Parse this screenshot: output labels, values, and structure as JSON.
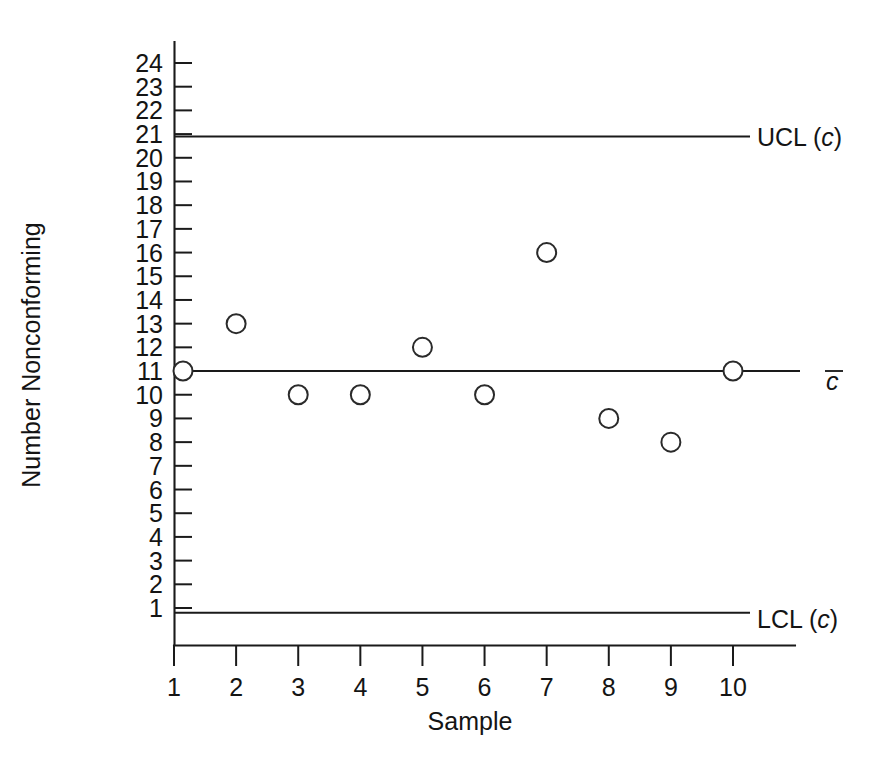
{
  "chart_data": {
    "type": "scatter",
    "title": "",
    "xlabel": "Sample",
    "ylabel": "Number Nonconforming",
    "x": [
      1,
      2,
      3,
      4,
      5,
      6,
      7,
      8,
      9,
      10
    ],
    "values": [
      11,
      13,
      10,
      10,
      12,
      10,
      16,
      9,
      8,
      11
    ],
    "categories": [
      "1",
      "2",
      "3",
      "4",
      "5",
      "6",
      "7",
      "8",
      "9",
      "10"
    ],
    "xtick_labels": [
      "1",
      "2",
      "3",
      "4",
      "5",
      "6",
      "7",
      "8",
      "9",
      "10"
    ],
    "ytick_labels": [
      "1",
      "2",
      "3",
      "4",
      "5",
      "6",
      "7",
      "8",
      "9",
      "10",
      "11",
      "12",
      "13",
      "14",
      "15",
      "16",
      "17",
      "18",
      "19",
      "20",
      "21",
      "22",
      "23",
      "24"
    ],
    "ytick_values": [
      1,
      2,
      3,
      4,
      5,
      6,
      7,
      8,
      9,
      10,
      11,
      12,
      13,
      14,
      15,
      16,
      17,
      18,
      19,
      20,
      21,
      22,
      23,
      24
    ],
    "xlim": [
      0.6,
      10.6
    ],
    "ylim": [
      0,
      25
    ],
    "grid": false,
    "legend_position": "right-inline",
    "marker_style": "open-circle",
    "series": [
      {
        "name": "Number Nonconforming",
        "values": [
          11,
          13,
          10,
          10,
          12,
          10,
          16,
          9,
          8,
          11
        ]
      }
    ],
    "reference_lines": [
      {
        "name": "upper-control-limit",
        "label": "UCL (c)",
        "label_prefix": "UCL (",
        "label_italic": "c",
        "label_suffix": ")",
        "value": 20.9
      },
      {
        "name": "center-line",
        "label": "c",
        "label_italic": "c",
        "overbar": true,
        "value": 11.0
      },
      {
        "name": "lower-control-limit",
        "label": "LCL (c)",
        "label_prefix": "LCL (",
        "label_italic": "c",
        "label_suffix": ")",
        "value": 0.8
      }
    ],
    "colors": {
      "line": "#1a1a1a",
      "marker_fill": "#ffffff",
      "marker_stroke": "#2a2a2a",
      "background": "#ffffff"
    }
  }
}
